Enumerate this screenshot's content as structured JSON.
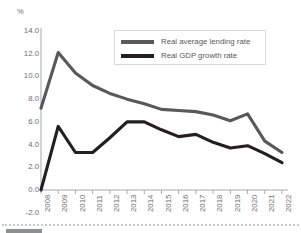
{
  "chart_data": {
    "type": "line",
    "title": "",
    "subtitle": "",
    "xlabel": "",
    "ylabel": "",
    "unit_label": "%",
    "categories": [
      "2008",
      "2009",
      "2010",
      "2011",
      "2012",
      "2013",
      "2014",
      "2015",
      "2016",
      "2017",
      "2018",
      "2019",
      "2020",
      "2021",
      "2022"
    ],
    "x": [
      2008,
      2009,
      2010,
      2011,
      2012,
      2013,
      2014,
      2015,
      2016,
      2017,
      2018,
      2019,
      2020,
      2021,
      2022
    ],
    "xlim": [
      2008,
      2022
    ],
    "ylim": [
      -2.0,
      14.0
    ],
    "yticks": [
      "14.0",
      "12.0",
      "10.0",
      "8.0",
      "6.0",
      "4.0",
      "2.0",
      "0.0",
      "-2.0"
    ],
    "ytick_values": [
      14.0,
      12.0,
      10.0,
      8.0,
      6.0,
      4.0,
      2.0,
      0.0,
      -2.0
    ],
    "grid": false,
    "legend_position": "top-center",
    "series": [
      {
        "name": "Real average lending rate",
        "color": "#58595b",
        "values": [
          7.2,
          12.1,
          10.3,
          9.2,
          8.5,
          8.0,
          7.6,
          7.1,
          7.0,
          6.9,
          6.6,
          6.1,
          6.7,
          4.3,
          3.3
        ]
      },
      {
        "name": "Real GDP growth rate",
        "color": "#231f20",
        "values": [
          0.0,
          5.6,
          3.3,
          3.3,
          4.6,
          6.0,
          6.0,
          5.3,
          4.7,
          4.9,
          4.2,
          3.7,
          3.9,
          3.2,
          2.4
        ]
      }
    ]
  },
  "legend": {
    "items": [
      {
        "label": "Real average lending rate"
      },
      {
        "label": "Real GDP growth rate"
      }
    ]
  }
}
